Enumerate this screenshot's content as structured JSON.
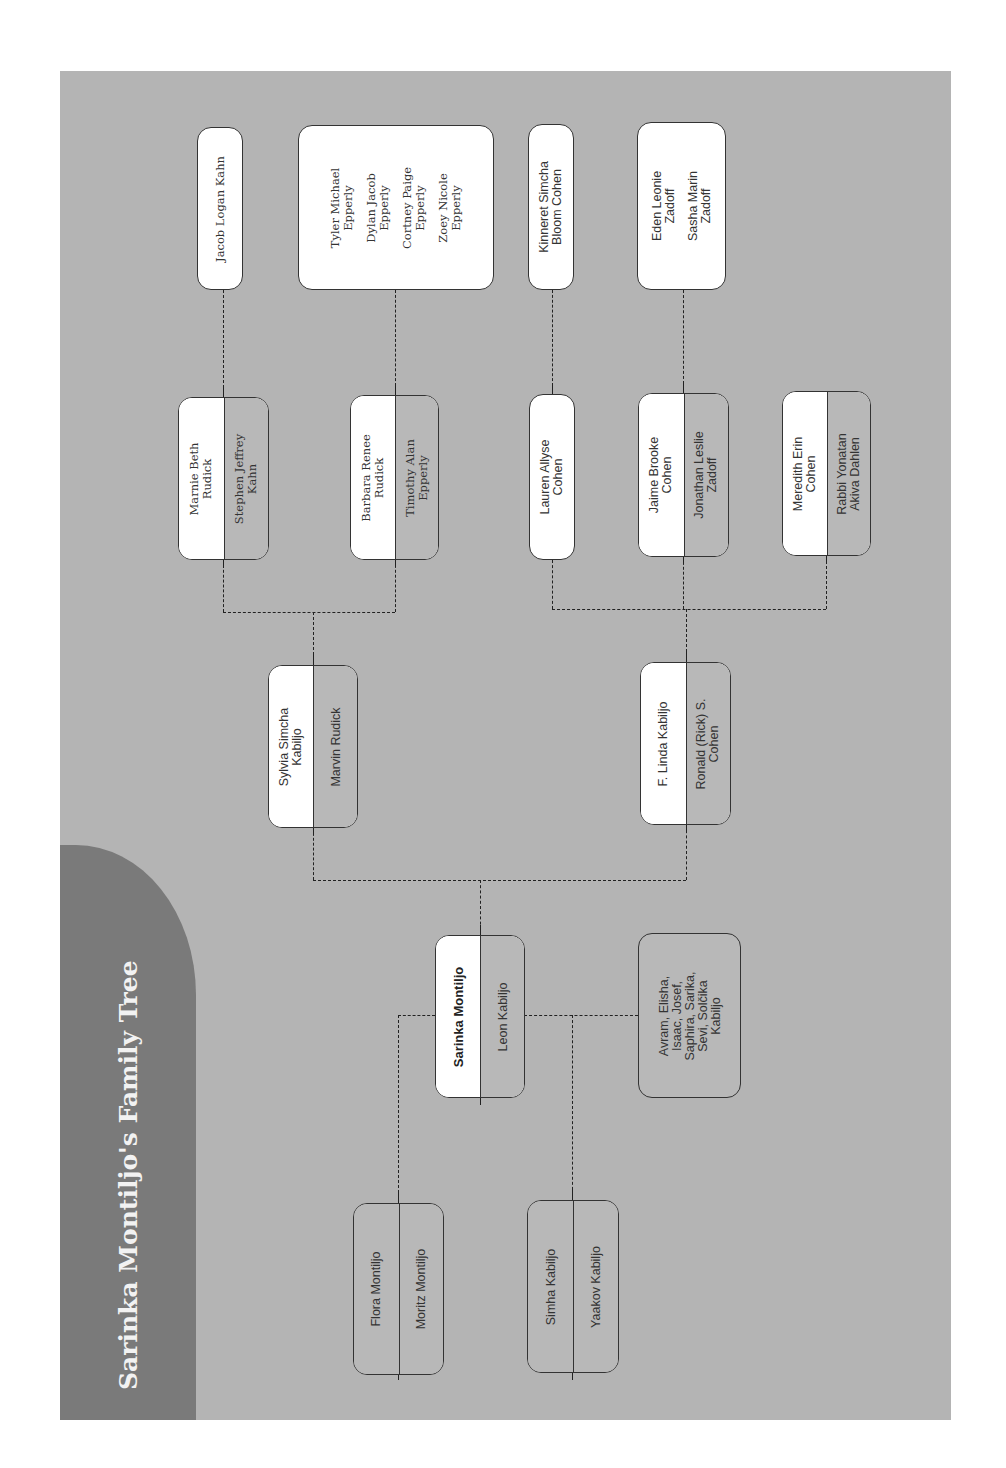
{
  "title": "Sarinka Montiljo's Family Tree",
  "colors": {
    "page_background": "#ffffff",
    "panel_background": "#b4b4b4",
    "title_band": "#7a7a7a",
    "box_light": "#ffffff",
    "box_gray": "#b8b8b8",
    "line": "#222222"
  },
  "generations": {
    "grandparents": [
      {
        "person": "Flora Montiljo",
        "spouse": "Moritz Montiljo"
      },
      {
        "person": "Simha Kabiljo",
        "spouse": "Yaakov Kabiljo"
      }
    ],
    "root": {
      "person": "Sarinka Montiljo",
      "spouse": "Leon Kabiljo"
    },
    "siblings": {
      "lines": [
        "Avram, Elisha,",
        "Isaac, Josef,",
        "Saphira, Sarika,",
        "Sevi, Solčika",
        "Kabiljo"
      ]
    },
    "children": [
      {
        "person": [
          "Sylvia Simcha",
          "Kabiljo"
        ],
        "spouse": [
          "Marvin Rudick"
        ]
      },
      {
        "person": [
          "F. Linda Kabiljo"
        ],
        "spouse": [
          "Ronald (Rick) S.",
          "Cohen"
        ]
      }
    ],
    "grandchildren": [
      {
        "person": [
          "Marnie Beth",
          "Rudick"
        ],
        "spouse": [
          "Stephen Jeffrey",
          "Kahn"
        ]
      },
      {
        "person": [
          "Barbara Renee",
          "Rudick"
        ],
        "spouse": [
          "Timothy Alan",
          "Epperly"
        ]
      },
      {
        "person": [
          "Lauren Allyse",
          "Cohen"
        ]
      },
      {
        "person": [
          "Jaime Brooke",
          "Cohen"
        ],
        "spouse": [
          "Jonathan Leslie",
          "Zadoff"
        ]
      },
      {
        "person": [
          "Meredith Erin",
          "Cohen"
        ],
        "spouse": [
          "Rabbi Yonatan",
          "Akiva Dahlen"
        ]
      }
    ],
    "great_grandchildren": [
      {
        "names": [
          [
            "Jacob Logan Kahn"
          ]
        ]
      },
      {
        "names": [
          [
            "Tyler Michael",
            "Epperly"
          ],
          [
            "Dylan Jacob",
            "Epperly"
          ],
          [
            "Cortney Paige",
            "Epperly"
          ],
          [
            "Zoey Nicole",
            "Epperly"
          ]
        ]
      },
      {
        "names": [
          [
            "Kinneret Simcha",
            "Bloom Cohen"
          ]
        ]
      },
      {
        "names": [
          [
            "Eden Leonie",
            "Zadoff"
          ],
          [
            "Sasha Marin",
            "Zadoff"
          ]
        ]
      }
    ]
  }
}
